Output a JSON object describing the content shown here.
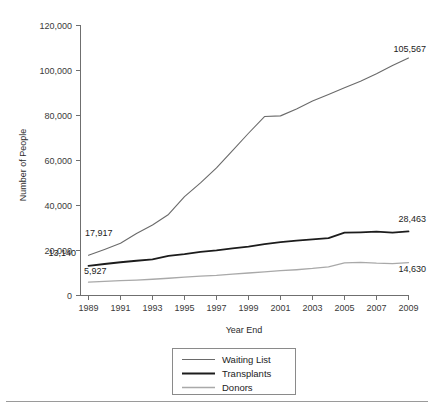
{
  "chart_data": {
    "type": "line",
    "title": "",
    "xlabel": "Year End",
    "ylabel": "Number of People",
    "x": [
      1989,
      1990,
      1991,
      1992,
      1993,
      1994,
      1995,
      1996,
      1997,
      1998,
      1999,
      2000,
      2001,
      2002,
      2003,
      2004,
      2005,
      2006,
      2007,
      2008,
      2009
    ],
    "xticks": [
      "1989",
      "1991",
      "1993",
      "1995",
      "1997",
      "1999",
      "2001",
      "2003",
      "2005",
      "2007",
      "2009"
    ],
    "xlim": [
      1989,
      2009
    ],
    "yticks": [
      "0",
      "20,000",
      "40,000",
      "60,000",
      "80,000",
      "100,000",
      "120,000"
    ],
    "ylim": [
      0,
      120000
    ],
    "grid": false,
    "legend_position": "bottom-center",
    "series": [
      {
        "name": "Waiting List",
        "color": "#6a6a6a",
        "width": 1.1,
        "values": [
          17917,
          20481,
          23198,
          27563,
          31355,
          36013,
          43937,
          50047,
          56716,
          64423,
          72110,
          79523,
          79830,
          82885,
          86395,
          89347,
          92326,
          95240,
          98572,
          102206,
          105567
        ],
        "start_label": "17,917",
        "end_label": "105,567"
      },
      {
        "name": "Transplants",
        "color": "#1c1c1c",
        "width": 1.8,
        "values": [
          13140,
          14000,
          14780,
          15435,
          16079,
          17630,
          18348,
          19381,
          20013,
          20961,
          21710,
          22854,
          23677,
          24345,
          24923,
          25462,
          27963,
          28091,
          28357,
          27958,
          28463
        ],
        "start_label": "13,140",
        "end_label": "28,463"
      },
      {
        "name": "Donors",
        "color": "#a9a9a9",
        "width": 1.3,
        "values": [
          5927,
          6241,
          6594,
          6871,
          7222,
          7673,
          8143,
          8634,
          8961,
          9534,
          10001,
          10486,
          11021,
          11455,
          12013,
          12732,
          14487,
          14753,
          14400,
          14208,
          14630
        ],
        "start_label": "5,927",
        "end_label": "14,630"
      }
    ],
    "annotations": [
      {
        "text": "17,917",
        "series": "Waiting List",
        "position": "start"
      },
      {
        "text": "13,140",
        "series": "Transplants",
        "position": "start"
      },
      {
        "text": "5,927",
        "series": "Donors",
        "position": "start"
      },
      {
        "text": "105,567",
        "series": "Waiting List",
        "position": "end"
      },
      {
        "text": "28,463",
        "series": "Transplants",
        "position": "end"
      },
      {
        "text": "14,630",
        "series": "Donors",
        "position": "end"
      }
    ]
  },
  "legend": {
    "items": [
      {
        "label": "Waiting List"
      },
      {
        "label": "Transplants"
      },
      {
        "label": "Donors"
      }
    ]
  }
}
